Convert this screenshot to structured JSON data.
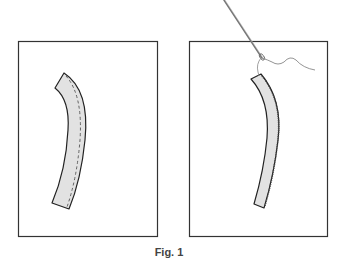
{
  "figure": {
    "caption": "Fig. 1",
    "panels": [
      {
        "id": "left",
        "description": "curved fabric strip with dashed stitching line along right edge"
      },
      {
        "id": "right",
        "description": "narrow curved strip being hand-sewn with needle and thread"
      }
    ],
    "colors": {
      "outline": "#222222",
      "strip_fill": "#e2e2e2",
      "needle": "#777777",
      "thread": "#888888"
    }
  }
}
